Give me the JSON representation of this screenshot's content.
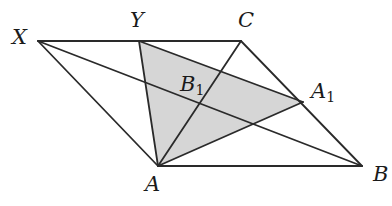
{
  "diagram": {
    "type": "geometry",
    "colors": {
      "line": "#2a2a2a",
      "shade": "#d6d6d6",
      "background": "#ffffff"
    },
    "points": {
      "X": {
        "label": "X",
        "sub": "",
        "x": 38,
        "y": 41
      },
      "Y": {
        "label": "Y",
        "sub": "",
        "x": 139,
        "y": 41
      },
      "C": {
        "label": "C",
        "sub": "",
        "x": 241,
        "y": 41
      },
      "A1": {
        "label": "A",
        "sub": "1",
        "x": 303,
        "y": 102
      },
      "B": {
        "label": "B",
        "sub": "",
        "x": 362,
        "y": 166
      },
      "A": {
        "label": "A",
        "sub": "",
        "x": 158,
        "y": 166
      },
      "B1": {
        "label": "B",
        "sub": "1",
        "x": 148,
        "y": 86
      }
    },
    "segments": [
      [
        "X",
        "C"
      ],
      [
        "C",
        "B"
      ],
      [
        "B",
        "A"
      ],
      [
        "A",
        "X"
      ],
      [
        "X",
        "B"
      ],
      [
        "A",
        "C"
      ],
      [
        "A",
        "Y"
      ],
      [
        "Y",
        "A1"
      ],
      [
        "A",
        "A1"
      ]
    ],
    "shaded_polygon": [
      "A",
      "Y",
      "A1"
    ],
    "labels": [
      {
        "id": "X",
        "text": "X",
        "sub": "",
        "left": 12,
        "top": 27
      },
      {
        "id": "Y",
        "text": "Y",
        "sub": "",
        "left": 130,
        "top": 10
      },
      {
        "id": "C",
        "text": "C",
        "sub": "",
        "left": 238,
        "top": 10
      },
      {
        "id": "B1",
        "text": "B",
        "sub": "1",
        "left": 180,
        "top": 74
      },
      {
        "id": "A1",
        "text": "A",
        "sub": "1",
        "left": 311,
        "top": 81
      },
      {
        "id": "A",
        "text": "A",
        "sub": "",
        "left": 145,
        "top": 174
      },
      {
        "id": "B",
        "text": "B",
        "sub": "",
        "left": 373,
        "top": 164
      }
    ]
  }
}
